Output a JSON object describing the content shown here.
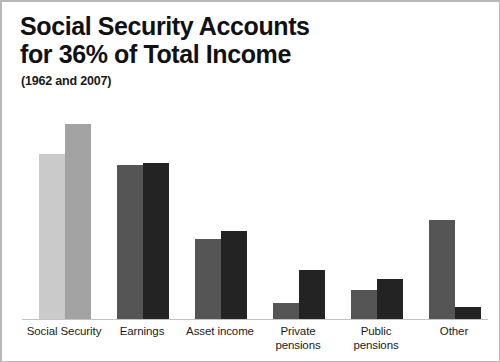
{
  "header": {
    "title": "Social Security Accounts\nfor 36% of Total Income",
    "subtitle": "(1962 and 2007)"
  },
  "chart_data": {
    "type": "bar",
    "title": "Social Security Accounts for 36% of Total Income",
    "subtitle": "(1962 and 2007)",
    "xlabel": "",
    "ylabel": "",
    "ylim": [
      0,
      42
    ],
    "grid": false,
    "legend": "none",
    "categories": [
      "Social Security",
      "Earnings",
      "Asset income",
      "Private pensions",
      "Public pensions",
      "Other"
    ],
    "series": [
      {
        "name": "1962",
        "color": "#c9c9c9",
        "values": [
          30.5,
          28.5,
          15.0,
          3.0,
          5.4,
          18.3
        ]
      },
      {
        "name": "2007",
        "color": "#a3a3a3",
        "values": [
          36.1,
          28.9,
          16.3,
          9.1,
          7.4,
          2.2
        ]
      }
    ],
    "group_colors": [
      {
        "a": "#cacaca",
        "b": "#a3a3a3"
      },
      {
        "a": "#555555",
        "b": "#232323"
      },
      {
        "a": "#555555",
        "b": "#232323"
      },
      {
        "a": "#555555",
        "b": "#232323"
      },
      {
        "a": "#555555",
        "b": "#232323"
      },
      {
        "a": "#555555",
        "b": "#232323"
      }
    ],
    "bar_tops_px": [
      [
        152,
        122
      ],
      [
        163,
        161
      ],
      [
        237,
        229
      ],
      [
        301,
        268
      ],
      [
        288,
        277
      ],
      [
        218,
        305
      ]
    ],
    "baseline_px": 317,
    "axis_tick_labels": [
      "Social Security",
      "Earnings",
      "Asset income",
      "Private\npensions",
      "Public\npensions",
      "Other"
    ]
  },
  "colors": {
    "background": "#ffffff",
    "border": "#b9b9b9",
    "baseline": "#c3c3c3",
    "text": "#111111"
  }
}
